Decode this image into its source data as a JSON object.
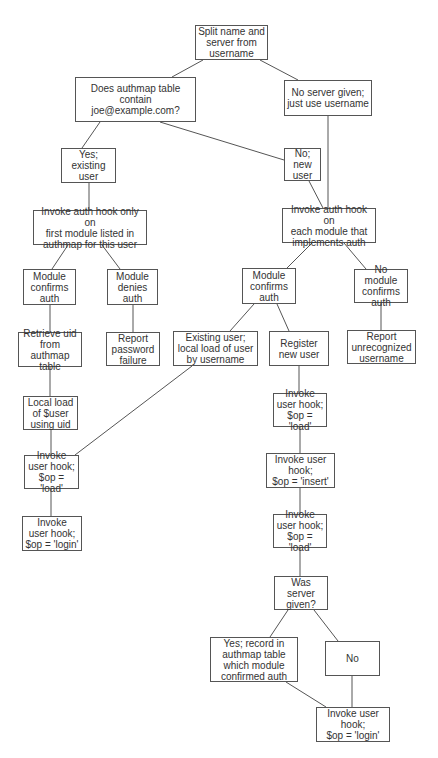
{
  "diagram": {
    "type": "flowchart",
    "nodes": {
      "split": "Split name and\nserver from\nusername",
      "authmap_query": "Does authmap table contain\njoe@example.com?",
      "no_server": "No server given;\njust use username",
      "yes_existing": "Yes;\nexisting\nuser",
      "no_new": "No; new\nuser",
      "auth_first_module": "Invoke auth hook only on\nfirst module listed in\nauthmap for this user",
      "auth_each_module": "Invoke auth hook on\neach module that\nimplements auth",
      "module_confirms_left": "Module\nconfirms\nauth",
      "module_denies": "Module\ndenies\nauth",
      "module_confirms_right": "Module\nconfirms\nauth",
      "no_module_confirms": "No module\nconfirms\nauth",
      "retrieve_uid": "Retrieve uid\nfrom authmap\ntable",
      "report_password_failure": "Report\npassword\nfailure",
      "existing_user_local_load": "Existing user;\nlocal load of user\nby username",
      "register_new_user": "Register\nnew user",
      "report_unrecognized": "Report\nunrecognized\nusername",
      "local_load_uid": "Local load\nof $user\nusing uid",
      "invoke_load_right_1": "Invoke\nuser hook;\n$op = 'load'",
      "invoke_load_left": "Invoke\nuser hook;\n$op = 'load'",
      "invoke_insert": "Invoke user\nhook;\n$op = 'insert'",
      "invoke_login_left": "Invoke\nuser hook;\n$op = 'login'",
      "invoke_load_right_2": "Invoke\nuser hook;\n$op = 'load'",
      "was_server_given": "Was server\ngiven?",
      "yes_record_authmap": "Yes; record in\nauthmap table\nwhich module\nconfirmed auth",
      "no": "No",
      "invoke_login_right": "Invoke user\nhook;\n$op = 'login'"
    },
    "edges": [
      [
        "split",
        "authmap_query"
      ],
      [
        "split",
        "no_server"
      ],
      [
        "authmap_query",
        "yes_existing"
      ],
      [
        "authmap_query",
        "no_new"
      ],
      [
        "no_server",
        "auth_each_module"
      ],
      [
        "yes_existing",
        "auth_first_module"
      ],
      [
        "no_new",
        "auth_each_module"
      ],
      [
        "auth_first_module",
        "module_confirms_left"
      ],
      [
        "auth_first_module",
        "module_denies"
      ],
      [
        "auth_each_module",
        "module_confirms_right"
      ],
      [
        "auth_each_module",
        "no_module_confirms"
      ],
      [
        "module_confirms_left",
        "retrieve_uid"
      ],
      [
        "module_denies",
        "report_password_failure"
      ],
      [
        "module_confirms_right",
        "existing_user_local_load"
      ],
      [
        "module_confirms_right",
        "register_new_user"
      ],
      [
        "no_module_confirms",
        "report_unrecognized"
      ],
      [
        "retrieve_uid",
        "local_load_uid"
      ],
      [
        "local_load_uid",
        "invoke_load_left"
      ],
      [
        "existing_user_local_load",
        "invoke_load_left"
      ],
      [
        "invoke_load_left",
        "invoke_login_left"
      ],
      [
        "register_new_user",
        "invoke_load_right_1"
      ],
      [
        "invoke_load_right_1",
        "invoke_insert"
      ],
      [
        "invoke_insert",
        "invoke_load_right_2"
      ],
      [
        "invoke_load_right_2",
        "was_server_given"
      ],
      [
        "was_server_given",
        "yes_record_authmap"
      ],
      [
        "was_server_given",
        "no"
      ],
      [
        "yes_record_authmap",
        "invoke_login_right"
      ],
      [
        "no",
        "invoke_login_right"
      ]
    ]
  }
}
